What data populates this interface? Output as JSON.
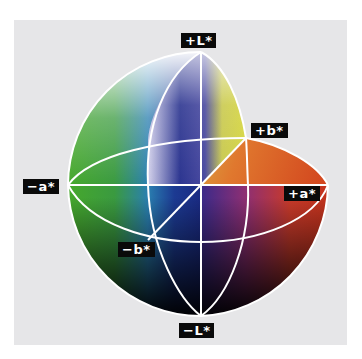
{
  "figure": {
    "background_color": "#e6e6e8",
    "axis_line_color": "#ffffff"
  },
  "labels": {
    "plus_L": "+L*",
    "minus_L": "−L*",
    "plus_a": "+a*",
    "minus_a": "−a*",
    "plus_b": "+b*",
    "minus_b": "−b*"
  },
  "colors": {
    "white_top": "#ffffff",
    "black_bottom": "#000000",
    "green": "#3f9e2a",
    "cyan": "#4fb3d6",
    "blue": "#1a2f8a",
    "yellow": "#d9d63a",
    "orange": "#e0622a",
    "red": "#b3241c",
    "magenta": "#8e2f73"
  }
}
